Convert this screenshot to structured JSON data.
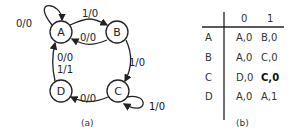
{
  "diagram_a": {
    "caption": "(a)",
    "nodes": [
      {
        "id": "A",
        "label": "A"
      },
      {
        "id": "B",
        "label": "B"
      },
      {
        "id": "C",
        "label": "C"
      },
      {
        "id": "D",
        "label": "D"
      }
    ],
    "edges": [
      {
        "from": "A",
        "to": "A",
        "label": "0/0"
      },
      {
        "from": "A",
        "to": "B",
        "label": "1/0"
      },
      {
        "from": "B",
        "to": "A",
        "label": "0/0"
      },
      {
        "from": "B",
        "to": "C",
        "label": "1/0"
      },
      {
        "from": "C",
        "to": "C",
        "label": "1/0"
      },
      {
        "from": "C",
        "to": "D",
        "label": "0/0"
      },
      {
        "from": "D",
        "to": "A",
        "label_line1": "0/0",
        "label_line2": "1/1"
      }
    ]
  },
  "table_b": {
    "caption": "(b)",
    "columns": [
      "0",
      "1"
    ],
    "rows": [
      {
        "state": "A",
        "on0": "A,0",
        "on1": "B,0"
      },
      {
        "state": "B",
        "on0": "A,0",
        "on1": "C,0"
      },
      {
        "state": "C",
        "on0": "D,0",
        "on1": "C,0"
      },
      {
        "state": "D",
        "on0": "A,0",
        "on1": "A,1"
      }
    ]
  }
}
